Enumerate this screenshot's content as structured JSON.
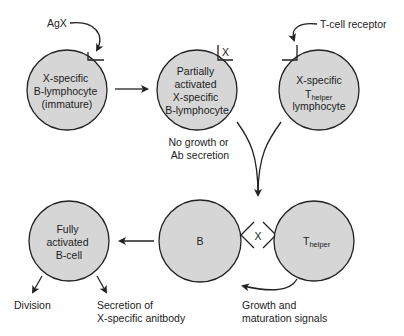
{
  "cells": {
    "immature_b": {
      "lines": [
        "X-specific",
        "B-lymphocyte",
        "(immature)"
      ]
    },
    "partial_b": {
      "lines": [
        "Partially",
        "activated",
        "X-specific",
        "B-lymphocyte"
      ]
    },
    "t_helper": {
      "line1": "X-specific",
      "t_main": "T",
      "t_sub": "helper",
      "line3": "lymphocyte"
    },
    "full_b": {
      "lines": [
        "Fully",
        "activated",
        "B-cell"
      ]
    },
    "b": {
      "label": "B"
    },
    "t_helper_bottom": {
      "t_main": "T",
      "t_sub": "helper"
    }
  },
  "labels": {
    "antigen": "AgX",
    "tcr": "T-cell receptor",
    "antigen_bound": "X",
    "antigen_bridge": "X",
    "no_growth": [
      "No growth or",
      "Ab secretion"
    ],
    "division": "Division",
    "secretion": [
      "Secretion of",
      "X-specific anitbody"
    ],
    "growth": [
      "Growth and",
      "maturation signals"
    ]
  }
}
